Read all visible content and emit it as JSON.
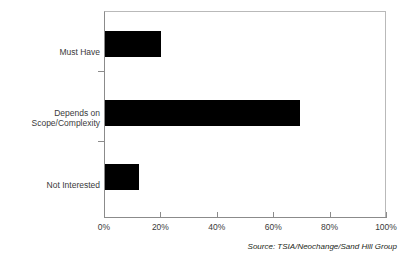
{
  "chart_data": {
    "type": "bar",
    "orientation": "horizontal",
    "title": "",
    "xlabel": "",
    "ylabel": "",
    "categories": [
      "Must Have",
      "Depends on\nScope/Complexity",
      "Not Interested"
    ],
    "values": [
      20,
      69,
      12
    ],
    "value_unit": "%",
    "xlim": [
      0,
      100
    ],
    "xticks": [
      0,
      20,
      40,
      60,
      80,
      100
    ],
    "xtick_labels": [
      "0%",
      "20%",
      "40%",
      "60%",
      "80%",
      "100%"
    ],
    "grid": false,
    "legend": null,
    "bar_color": "#000000",
    "axis_color": "#8b8b8b",
    "series": [
      {
        "name": "Response share",
        "values": [
          20,
          69,
          12
        ]
      }
    ],
    "annotations": [
      "Source: TSIA/Neochange/Sand Hill Group"
    ]
  },
  "figure": {
    "source_note": "Source: TSIA/Neochange/Sand Hill Group",
    "background_color": "#ffffff",
    "text_color": "#231f20"
  }
}
